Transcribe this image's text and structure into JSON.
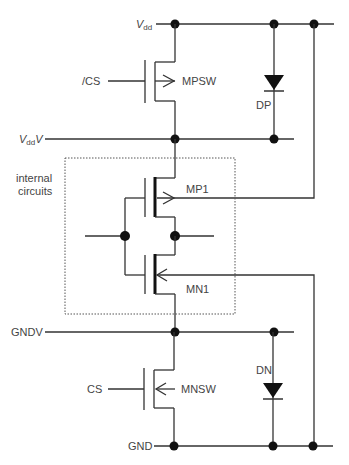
{
  "diagram": {
    "title": "",
    "rails": {
      "vdd": {
        "label_main": "V",
        "label_sub": "dd"
      },
      "vddv": {
        "label_main": "V",
        "label_sub": "dd",
        "label_suffix": "V"
      },
      "gndv": {
        "label": "GNDV"
      },
      "gnd": {
        "label": "GND"
      }
    },
    "signals": {
      "cs_bar": "/CS",
      "cs": "CS"
    },
    "components": {
      "mpsw": "MPSW",
      "mp1": "MP1",
      "mn1": "MN1",
      "mnsw": "MNSW",
      "dp": "DP",
      "dn": "DN"
    },
    "group": {
      "label_line1": "internal",
      "label_line2": "circuits"
    },
    "colors": {
      "wire": "#333333",
      "text": "#444444",
      "background": "#ffffff"
    }
  }
}
